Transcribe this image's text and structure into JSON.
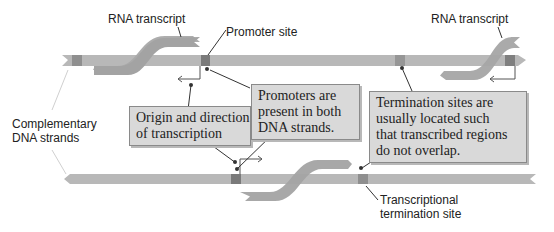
{
  "labels": {
    "rna_transcript_left": "RNA transcript",
    "rna_transcript_right": "RNA transcript",
    "promoter_site": "Promoter site",
    "complementary_line1": "Complementary",
    "complementary_line2": "DNA strands",
    "termination_line1": "Transcriptional",
    "termination_line2": "termination site"
  },
  "callouts": {
    "origin": {
      "line1": "Origin and direction",
      "line2": "of transcription"
    },
    "promoters": {
      "line1": "Promoters are",
      "line2": "present in both",
      "line3": "DNA strands."
    },
    "termination": {
      "line1": "Termination sites are",
      "line2": "usually located such",
      "line3": "that transcribed regions",
      "line4": "do not overlap."
    }
  },
  "colors": {
    "strand": "#b5b5b5",
    "site": "#8a8a8a",
    "rna": "#a6a6a6",
    "box_fill": "#d9d9d9",
    "leader": "#333333"
  }
}
